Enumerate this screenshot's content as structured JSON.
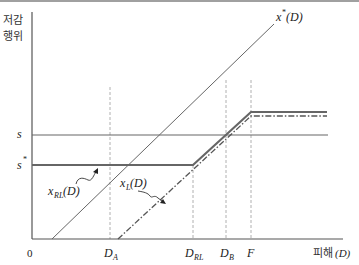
{
  "diagram": {
    "y_axis_label_line1": "저감",
    "y_axis_label_line2": "행위",
    "x_axis_label_prefix": "피해",
    "x_axis_label_var": "(D)",
    "origin_label": "0",
    "y_ticks": [
      {
        "label": "s",
        "sup": "",
        "y": 135
      },
      {
        "label": "s",
        "sup": "*",
        "y": 165
      }
    ],
    "x_ticks": [
      {
        "label": "D",
        "sub": "A",
        "x": 110
      },
      {
        "label": "D",
        "sub": "RL",
        "x": 193
      },
      {
        "label": "D",
        "sub": "B",
        "x": 226
      },
      {
        "label": "F",
        "sub": "",
        "x": 251
      }
    ],
    "curves": {
      "x_star": {
        "label": "x",
        "sup": "*",
        "arg": "(D)",
        "style": "thin solid"
      },
      "x_RL": {
        "label": "x",
        "sub": "RL",
        "arg": "(D)",
        "style": "thick solid"
      },
      "x_L": {
        "label": "x",
        "sub": "L",
        "arg": "(D)",
        "style": "dash-dot"
      }
    },
    "colors": {
      "axis": "#555555",
      "thick_line": "#666666",
      "thin_line": "#666666",
      "dashed": "#aaaaaa",
      "text": "#222222"
    }
  }
}
